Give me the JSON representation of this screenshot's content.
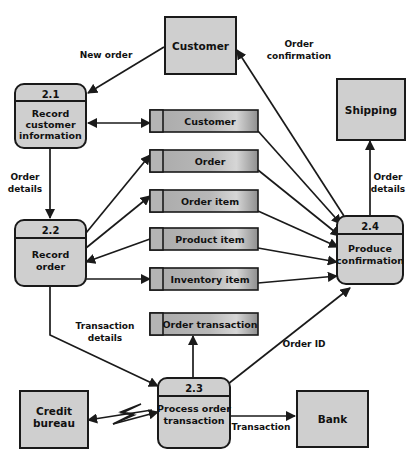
{
  "diagram": {
    "type": "data-flow-diagram",
    "background_color": "#ffffff",
    "shape_fill_color": "#cfcfcf",
    "store_tab_color": "#b4b4b4",
    "line_color": "#1a1a1a"
  },
  "external_entities": [
    {
      "id": "customer",
      "label": "Customer"
    },
    {
      "id": "shipping",
      "label": "Shipping"
    },
    {
      "id": "credit_bureau",
      "label": "Credit\nbureau",
      "line1": "Credit",
      "line2": "bureau"
    },
    {
      "id": "bank",
      "label": "Bank"
    }
  ],
  "processes": [
    {
      "id": "p21",
      "number": "2.1",
      "line1": "Record",
      "line2": "customer",
      "line3": "information"
    },
    {
      "id": "p22",
      "number": "2.2",
      "line1": "Record",
      "line2": "order",
      "line3": ""
    },
    {
      "id": "p23",
      "number": "2.3",
      "line1": "Process order",
      "line2": "transaction",
      "line3": ""
    },
    {
      "id": "p24",
      "number": "2.4",
      "line1": "Produce",
      "line2": "confirmation",
      "line3": ""
    }
  ],
  "data_stores": [
    {
      "id": "store_customer",
      "label": "Customer"
    },
    {
      "id": "store_order",
      "label": "Order"
    },
    {
      "id": "store_order_item",
      "label": "Order item"
    },
    {
      "id": "store_product_item",
      "label": "Product item"
    },
    {
      "id": "store_inventory_item",
      "label": "Inventory item"
    },
    {
      "id": "store_order_transaction",
      "label": "Order transaction"
    }
  ],
  "flow_labels": [
    {
      "id": "new_order",
      "text": "New order"
    },
    {
      "id": "order_confirmation_l1",
      "text": "Order"
    },
    {
      "id": "order_confirmation_l2",
      "text": "confirmation"
    },
    {
      "id": "order_details_left_l1",
      "text": "Order"
    },
    {
      "id": "order_details_left_l2",
      "text": "details"
    },
    {
      "id": "order_details_right_l1",
      "text": "Order"
    },
    {
      "id": "order_details_right_l2",
      "text": "details"
    },
    {
      "id": "transaction_details_l1",
      "text": "Transaction"
    },
    {
      "id": "transaction_details_l2",
      "text": "details"
    },
    {
      "id": "order_id",
      "text": "Order ID"
    },
    {
      "id": "transaction",
      "text": "Transaction"
    }
  ]
}
